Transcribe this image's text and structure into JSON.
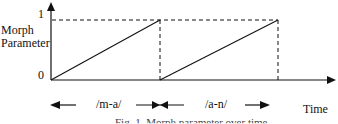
{
  "diagram": {
    "y_axis_label_line1": "Morph",
    "y_axis_label_line2": "Parameter",
    "y_tick_top": "1",
    "y_tick_bottom": "0",
    "x_axis_label": "Time",
    "segments": [
      {
        "label": "/m-a/",
        "value_start": 0,
        "value_end": 1
      },
      {
        "label": "/a-n/",
        "value_start": 0,
        "value_end": 1
      }
    ],
    "caption_partial": "Fig. 1. Morph parameter over time",
    "colors": {
      "line": "#111111",
      "background": "#ffffff"
    }
  }
}
